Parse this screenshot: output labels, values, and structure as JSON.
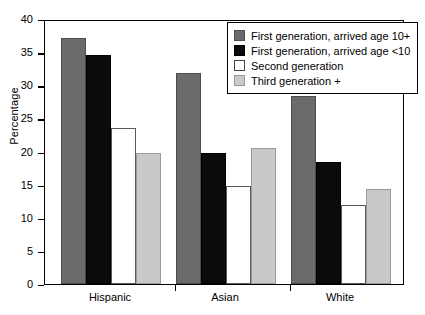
{
  "chart_data": {
    "type": "bar",
    "title": "",
    "xlabel": "",
    "ylabel": "Percentage",
    "ylim": [
      0,
      40
    ],
    "yticks": [
      0,
      5,
      10,
      15,
      20,
      25,
      30,
      35,
      40
    ],
    "ytick_labels": [
      "0",
      "5",
      "10",
      "15",
      "20",
      "25",
      "30",
      "35",
      "40"
    ],
    "grid": false,
    "legend_position": "top-right",
    "categories": [
      "Hispanic",
      "Asian",
      "White"
    ],
    "series": [
      {
        "name": "First generation, arrived age 10+",
        "color": "#6b6b6b",
        "values": [
          37.1,
          31.9,
          28.4
        ]
      },
      {
        "name": "First generation, arrived age <10",
        "color": "#0b0b0b",
        "values": [
          34.6,
          19.8,
          18.4
        ]
      },
      {
        "name": "Second generation",
        "color": "#ffffff",
        "values": [
          23.6,
          14.8,
          11.9
        ]
      },
      {
        "name": "Third generation +",
        "color": "#c9c9c9",
        "values": [
          19.8,
          20.6,
          14.3
        ]
      }
    ]
  },
  "axis": {
    "y_label": "Percentage"
  }
}
